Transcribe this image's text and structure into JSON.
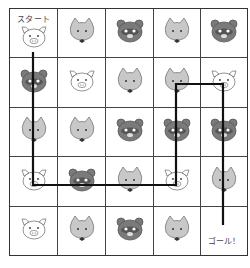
{
  "puzzle": {
    "start_label": "スタート",
    "goal_label": "ゴール！",
    "rows": 5,
    "cols": 5,
    "cells": [
      [
        "pig",
        "cat",
        "bear",
        "cat",
        "bear"
      ],
      [
        "bear",
        "pig",
        "cat",
        "cat",
        "pig"
      ],
      [
        "cat",
        "cat",
        "bear",
        "bear",
        "bear"
      ],
      [
        "pig",
        "bear",
        "cat",
        "pig",
        "cat"
      ],
      [
        "pig",
        "cat",
        "bear",
        "cat",
        "goal"
      ]
    ],
    "path_points": [
      [
        33,
        52
      ],
      [
        33,
        185
      ],
      [
        176,
        185
      ],
      [
        176,
        84
      ],
      [
        223,
        84
      ],
      [
        223,
        225
      ]
    ],
    "colors": {
      "grid_line": "#444444",
      "path": "#111111",
      "cat_fill": "#c8c8c8",
      "bear_fill": "#7a7a7a",
      "pig_fill": "#ffffff"
    }
  }
}
